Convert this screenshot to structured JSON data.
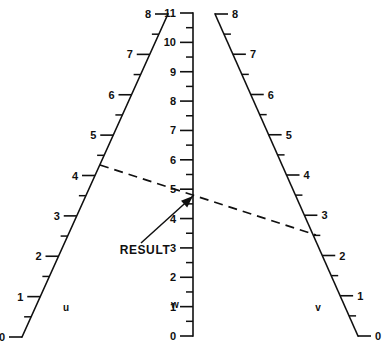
{
  "figure": {
    "type": "nomogram",
    "title": "",
    "background_color": "#ffffff",
    "ink_color": "#101010",
    "width": 388,
    "height": 349
  },
  "annotation": {
    "result_label": "RESULT",
    "result_label_x": 145,
    "result_label_y": 254,
    "arrow_tip_x": 193,
    "arrow_tip_y": 196,
    "leader_start_x": 141,
    "leader_start_y": 243
  },
  "index_line": {
    "style": "dashed",
    "from_scale": "u",
    "from_value": 3,
    "to_scale": "v",
    "to_value": 2,
    "result_scale": "w",
    "x1": 100,
    "y1": 165,
    "x2": 316,
    "y2": 235
  },
  "chart_data": {
    "type": "nomogram",
    "title": "",
    "xlabel": "",
    "ylabel": "",
    "grid": false,
    "legend": "none",
    "axes": [
      {
        "name": "u",
        "label": "u",
        "label_x": 66,
        "label_y": 311,
        "label_side": "left",
        "orientation": "oblique",
        "range": [
          0,
          8
        ],
        "x_at_min": 22,
        "y_at_min": 337,
        "x_at_max": 168,
        "y_at_max": 14,
        "major_ticks": [
          0,
          1,
          2,
          3,
          4,
          5,
          6,
          7,
          8
        ],
        "minor_ticks": [
          0.5,
          1.5,
          2.5,
          3.5,
          4.5,
          5.5,
          6.5,
          7.5
        ],
        "tick_labels": [
          "0",
          "1",
          "2",
          "3",
          "4",
          "5",
          "6",
          "7",
          "8"
        ]
      },
      {
        "name": "w",
        "label": "w",
        "label_x": 175,
        "label_y": 308,
        "label_side": "left",
        "orientation": "vertical",
        "range": [
          0,
          11
        ],
        "x_at_min": 193,
        "y_at_min": 336,
        "x_at_max": 193,
        "y_at_max": 13,
        "major_ticks": [
          0,
          1,
          2,
          3,
          4,
          5,
          6,
          7,
          8,
          9,
          10,
          11
        ],
        "minor_ticks": [
          0.5,
          1.5,
          2.5,
          3.5,
          4.5,
          5.5,
          6.5,
          7.5,
          8.5,
          9.5,
          10.5
        ],
        "tick_labels": [
          "0",
          "1",
          "2",
          "3",
          "4",
          "5",
          "6",
          "7",
          "8",
          "9",
          "10",
          "11"
        ]
      },
      {
        "name": "v",
        "label": "v",
        "label_x": 318,
        "label_y": 311,
        "label_side": "right",
        "orientation": "oblique",
        "range": [
          0,
          8
        ],
        "x_at_min": 358,
        "y_at_min": 336,
        "x_at_max": 215,
        "y_at_max": 14,
        "major_ticks": [
          0,
          1,
          2,
          3,
          4,
          5,
          6,
          7,
          8
        ],
        "minor_ticks": [
          0.5,
          1.5,
          2.5,
          3.5,
          4.5,
          5.5,
          6.5,
          7.5
        ],
        "tick_labels": [
          "0",
          "1",
          "2",
          "3",
          "4",
          "5",
          "6",
          "7",
          "8"
        ]
      }
    ],
    "marked_points": [
      {
        "scale": "u",
        "value": 3
      },
      {
        "scale": "v",
        "value": 2
      },
      {
        "scale": "w",
        "value": 3.45,
        "label": "RESULT"
      }
    ]
  }
}
